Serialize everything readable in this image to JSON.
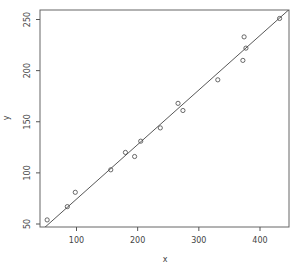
{
  "chart_data": {
    "type": "scatter",
    "title": "",
    "xlabel": "x",
    "ylabel": "y",
    "xlim": [
      42,
      448
    ],
    "ylim": [
      47,
      260
    ],
    "xticks": [
      100,
      200,
      300,
      400
    ],
    "yticks": [
      50,
      100,
      150,
      200,
      250
    ],
    "grid": false,
    "legend": null,
    "points": [
      {
        "x": 52,
        "y": 54
      },
      {
        "x": 85,
        "y": 67
      },
      {
        "x": 98,
        "y": 81
      },
      {
        "x": 156,
        "y": 103
      },
      {
        "x": 180,
        "y": 120
      },
      {
        "x": 195,
        "y": 116
      },
      {
        "x": 205,
        "y": 131
      },
      {
        "x": 237,
        "y": 144
      },
      {
        "x": 266,
        "y": 168
      },
      {
        "x": 274,
        "y": 161
      },
      {
        "x": 331,
        "y": 191
      },
      {
        "x": 372,
        "y": 210
      },
      {
        "x": 374,
        "y": 233
      },
      {
        "x": 377,
        "y": 222
      },
      {
        "x": 432,
        "y": 251
      }
    ],
    "fit_line": {
      "x0": 45,
      "y0": 45,
      "x1": 448,
      "y1": 260,
      "label": "regression line"
    }
  },
  "colors": {
    "axis": "#555555",
    "points": "#444444",
    "line": "#444444",
    "text": "#444444"
  }
}
